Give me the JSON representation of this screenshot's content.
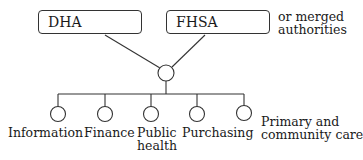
{
  "diagram": {
    "top_boxes": [
      {
        "id": "dha",
        "label": "DHA"
      },
      {
        "id": "fhsa",
        "label": "FHSA"
      }
    ],
    "top_note": {
      "line1": "or merged",
      "line2": "authorities"
    },
    "children": [
      {
        "label_line1": "Information",
        "label_line2": ""
      },
      {
        "label_line1": "Finance",
        "label_line2": ""
      },
      {
        "label_line1": "Public",
        "label_line2": "health"
      },
      {
        "label_line1": "Purchasing",
        "label_line2": ""
      },
      {
        "label_line1": "Primary and",
        "label_line2": "community care"
      }
    ],
    "colors": {
      "stroke": "#333333",
      "text": "#1a1a1a",
      "background": "#ffffff"
    }
  }
}
